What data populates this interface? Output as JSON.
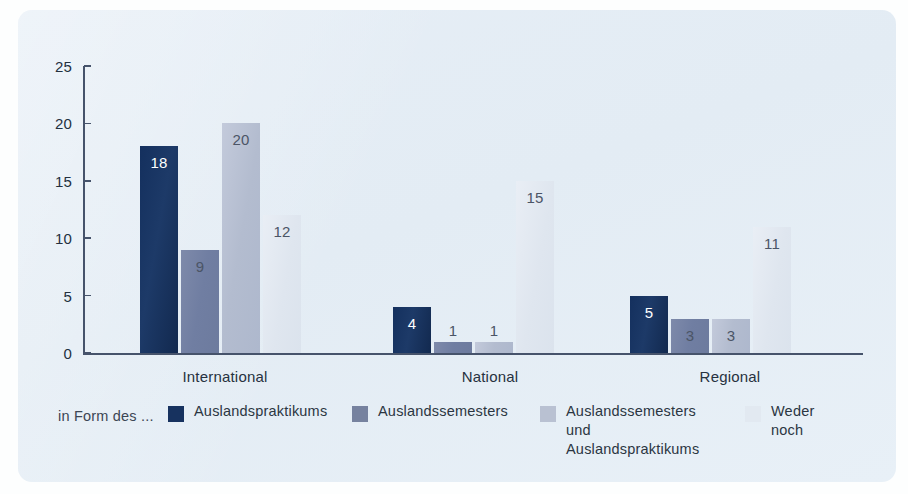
{
  "chart_data": {
    "type": "bar",
    "title": "",
    "xlabel": "",
    "ylabel": "",
    "ylim": [
      0,
      25
    ],
    "yticks": [
      0,
      5,
      10,
      15,
      20,
      25
    ],
    "grid": false,
    "legend_position": "bottom",
    "legend_prefix": "in Form des ...",
    "categories": [
      "International",
      "National",
      "Regional"
    ],
    "series": [
      {
        "name": "Auslandspraktikums",
        "color": "#17325f",
        "values": [
          18,
          4,
          5
        ]
      },
      {
        "name": "Auslandssemesters",
        "color": "#76829f",
        "values": [
          9,
          1,
          3
        ]
      },
      {
        "name": "Auslandssemesters und Auslandspraktikums",
        "color": "#b9c1d2",
        "values": [
          20,
          1,
          3
        ]
      },
      {
        "name": "Weder noch",
        "color": "#e2e9f1",
        "values": [
          12,
          15,
          11
        ]
      }
    ],
    "data_labels": [
      [
        18,
        9,
        20,
        12
      ],
      [
        4,
        1,
        1,
        15
      ],
      [
        5,
        3,
        3,
        11
      ]
    ]
  },
  "axis": {
    "y_tick_labels": [
      "0",
      "5",
      "10",
      "15",
      "20",
      "25"
    ]
  },
  "legend": {
    "prefix": "in Form des ...",
    "items": [
      {
        "label": "Auslandspraktikums"
      },
      {
        "label": "Auslandssemesters"
      },
      {
        "label": "Auslandssemesters und\nAuslandspraktikums"
      },
      {
        "label": "Weder noch"
      }
    ]
  },
  "colors": {
    "background_panel": "#e4edf5",
    "axis": "#46536b",
    "series_1": "#17325f",
    "series_2": "#76829f",
    "series_3": "#b9c1d2",
    "series_4": "#e2e9f1"
  }
}
